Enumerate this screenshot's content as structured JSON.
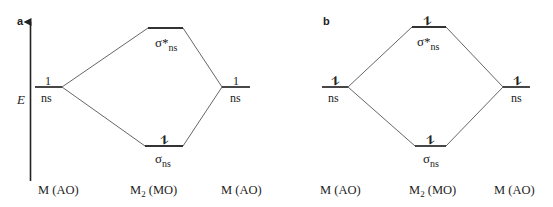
{
  "panels": [
    {
      "label": "a",
      "axis_label": "E",
      "left_ao": {
        "electrons": "1",
        "label": "ns"
      },
      "sigma_star": {
        "electrons": "",
        "label_main": "σ*",
        "label_sub": "ns"
      },
      "sigma": {
        "electrons": "⥮",
        "label_main": "σ",
        "label_sub": "ns"
      },
      "right_ao": {
        "electrons": "1",
        "label": "ns"
      },
      "bottom_labels": {
        "left": "M (AO)",
        "mid_main": "M",
        "mid_sub": "2",
        "mid_rest": " (MO)",
        "right": "M (AO)"
      }
    },
    {
      "label": "b",
      "left_ao": {
        "electrons": "⥮",
        "label": "ns"
      },
      "sigma_star": {
        "electrons": "⥮",
        "label_main": "σ*",
        "label_sub": "ns"
      },
      "sigma": {
        "electrons": "⥮",
        "label_main": "σ",
        "label_sub": "ns"
      },
      "right_ao": {
        "electrons": "⥮",
        "label": "ns"
      },
      "bottom_labels": {
        "left": "M (AO)",
        "mid_main": "M",
        "mid_sub": "2",
        "mid_rest": " (MO)",
        "right": "M (AO)"
      }
    }
  ],
  "colors": {
    "line": "#333333",
    "connector": "#555555",
    "background": "#ffffff"
  }
}
